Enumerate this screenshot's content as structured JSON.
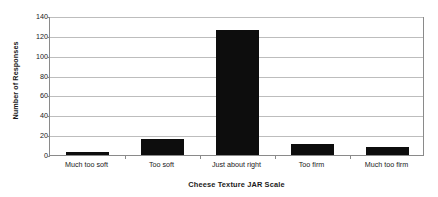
{
  "chart_data": {
    "type": "bar",
    "title": "",
    "xlabel": "Cheese Texture JAR Scale",
    "ylabel": "Number of Responses",
    "categories": [
      "Much too soft",
      "Too soft",
      "Just about right",
      "Too firm",
      "Much too firm"
    ],
    "values": [
      3,
      16,
      126,
      11,
      8
    ],
    "series": [
      {
        "name": "Number of Responses",
        "values": [
          3,
          16,
          126,
          11,
          8
        ]
      }
    ],
    "ylim": [
      0,
      140
    ],
    "ytick_labels": [
      "0",
      "20",
      "40",
      "60",
      "80",
      "100",
      "120",
      "140"
    ],
    "ytick_values": [
      0,
      20,
      40,
      60,
      80,
      100,
      120,
      140
    ],
    "grid": "horizontal",
    "legend": "none",
    "bar_color": "#0d0d0d",
    "gridline_color": "#bdbdbd",
    "axis_color": "#8a8a8a",
    "background_color": "#ffffff"
  }
}
